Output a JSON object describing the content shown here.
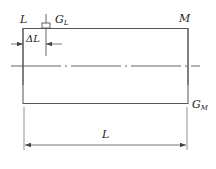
{
  "diagram": {
    "labels": {
      "top_left": "L",
      "gauge_left": "G",
      "gauge_left_sub": "L",
      "top_right": "M",
      "gauge_right": "G",
      "gauge_right_sub": "M",
      "delta": "ΔL",
      "length": "L"
    },
    "colors": {
      "line": "#555555",
      "text": "#222222"
    }
  }
}
